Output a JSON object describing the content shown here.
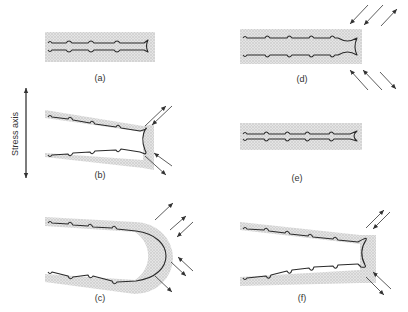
{
  "figure": {
    "stress_axis_label": "Stress axis",
    "panels": [
      {
        "id": "a",
        "label": "(a)",
        "description": "Sharp fatigue crack at minimum load, closed, with shaded plastic zone"
      },
      {
        "id": "b",
        "label": "(b)",
        "description": "Crack opening under tensile load; slip at tip blunts crack"
      },
      {
        "id": "c",
        "label": "(c)",
        "description": "Maximum tensile load; crack tip fully blunted into semicircle with slip arrows"
      },
      {
        "id": "d",
        "label": "(d)",
        "description": "Load reversal; compressive slip re-sharpens crack tip"
      },
      {
        "id": "e",
        "label": "(e)",
        "description": "Minimum load; crack closed with new striation and resharpened tip"
      },
      {
        "id": "f",
        "label": "(f)",
        "description": "Next cycle begins; crack opening again"
      }
    ]
  },
  "colors": {
    "line": "#2a2a2a",
    "plastic_zone": "#d4d4d4",
    "text": "#333333"
  }
}
